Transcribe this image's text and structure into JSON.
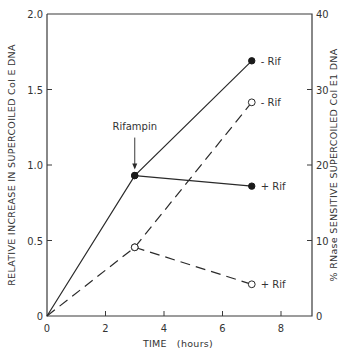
{
  "chart_data": {
    "type": "line",
    "title": "",
    "xlabel": "TIME   (hours)",
    "ylabel_left": "RELATIVE INCREASE IN SUPERCOILED Col E DNA",
    "ylabel_right": "% RNase SENSITIVE SUPERCOILED Col E1 DNA",
    "xlim": [
      0,
      9
    ],
    "ylim_left": [
      0,
      2.0
    ],
    "ylim_right": [
      0,
      40
    ],
    "x_ticks": [
      0,
      2,
      4,
      6,
      8
    ],
    "x_tick_labels": [
      "0",
      "2",
      "4",
      "6",
      "8"
    ],
    "y_left_ticks": [
      0,
      0.5,
      1.0,
      1.5,
      2.0
    ],
    "y_left_tick_labels": [
      "0",
      "0.5",
      "1.0",
      "1.5",
      "2.0"
    ],
    "y_right_ticks": [
      0,
      10,
      20,
      30,
      40
    ],
    "y_right_tick_labels": [
      "0",
      "10",
      "20",
      "30",
      "40"
    ],
    "grid": false,
    "annotations": [
      {
        "text": "Rifampin",
        "x": 3,
        "y_axis": "left",
        "points_to_y": 0.93,
        "arrow": "down"
      }
    ],
    "series": [
      {
        "name": "- Rif (supercoiled)",
        "label": "- Rif",
        "axis": "left",
        "style": "solid",
        "marker": "filled-circle",
        "x": [
          0,
          3,
          7
        ],
        "y": [
          0,
          0.93,
          1.69
        ]
      },
      {
        "name": "+ Rif (supercoiled)",
        "label": "+ Rif",
        "axis": "left",
        "style": "solid",
        "marker": "filled-circle",
        "x": [
          3,
          7
        ],
        "y": [
          0.93,
          0.86
        ]
      },
      {
        "name": "- Rif (RNase sensitive)",
        "label": "- Rif",
        "axis": "right",
        "style": "dashed",
        "marker": "open-circle",
        "x": [
          0,
          3,
          7
        ],
        "y": [
          0,
          9.1,
          28.3
        ]
      },
      {
        "name": "+ Rif (RNase sensitive)",
        "label": "+ Rif",
        "axis": "right",
        "style": "dashed",
        "marker": "open-circle",
        "x": [
          3,
          7
        ],
        "y": [
          9.1,
          4.2
        ]
      }
    ]
  }
}
